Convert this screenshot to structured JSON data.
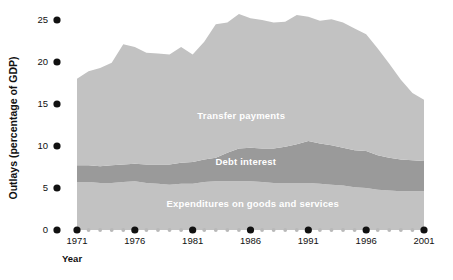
{
  "chart_data": {
    "type": "area",
    "stacked": true,
    "title": "",
    "subtitle": "",
    "xlabel": "Year",
    "ylabel": "Outlays (percentage of GDP)",
    "xlim": [
      1971,
      2001
    ],
    "ylim": [
      0,
      25
    ],
    "grid": false,
    "legend_position": "inline-annotations",
    "x_tick_labels": [
      "1971",
      "1976",
      "1981",
      "1986",
      "1991",
      "1996",
      "2001"
    ],
    "x_tick_values": [
      1971,
      1976,
      1981,
      1986,
      1991,
      1996,
      2001
    ],
    "x_minor_values": [
      1972,
      1973,
      1974,
      1975,
      1977,
      1978,
      1979,
      1980,
      1982,
      1983,
      1984,
      1985,
      1987,
      1988,
      1989,
      1990,
      1992,
      1993,
      1994,
      1995,
      1997,
      1998,
      1999,
      2000
    ],
    "y_tick_labels": [
      "0",
      "5",
      "10",
      "15",
      "20",
      "25"
    ],
    "y_tick_values": [
      0,
      5,
      10,
      15,
      20,
      25
    ],
    "x": [
      1971,
      1972,
      1973,
      1974,
      1975,
      1976,
      1977,
      1978,
      1979,
      1980,
      1981,
      1982,
      1983,
      1984,
      1985,
      1986,
      1987,
      1988,
      1989,
      1990,
      1991,
      1992,
      1993,
      1994,
      1995,
      1996,
      1997,
      1998,
      1999,
      2000,
      2001
    ],
    "series": [
      {
        "name": "Expenditures on goods and services",
        "color": "#c2c2c2",
        "values": [
          5.7,
          5.7,
          5.6,
          5.6,
          5.7,
          5.8,
          5.6,
          5.5,
          5.4,
          5.5,
          5.5,
          5.7,
          5.8,
          5.8,
          5.8,
          5.8,
          5.7,
          5.6,
          5.6,
          5.6,
          5.6,
          5.5,
          5.4,
          5.3,
          5.1,
          5.0,
          4.8,
          4.7,
          4.6,
          4.6,
          4.6
        ]
      },
      {
        "name": "Debt interest",
        "color": "#9a9a9a",
        "values": [
          2.0,
          2.0,
          2.0,
          2.1,
          2.1,
          2.1,
          2.2,
          2.3,
          2.4,
          2.5,
          2.6,
          2.7,
          2.8,
          3.4,
          3.9,
          4.0,
          4.0,
          4.1,
          4.3,
          4.6,
          5.0,
          4.8,
          4.7,
          4.5,
          4.4,
          4.4,
          4.1,
          3.9,
          3.8,
          3.7,
          3.6
        ]
      },
      {
        "name": "Transfer payments",
        "color": "#c2c2c2",
        "values": [
          10.3,
          11.2,
          11.7,
          12.2,
          14.3,
          13.9,
          13.3,
          13.2,
          13.1,
          13.8,
          12.8,
          14.0,
          15.9,
          15.5,
          16.0,
          15.4,
          15.3,
          15.0,
          14.9,
          15.4,
          14.8,
          14.6,
          15.0,
          14.9,
          14.5,
          13.9,
          12.7,
          11.2,
          9.5,
          8.0,
          7.3
        ]
      }
    ],
    "stack_totals": [
      18.0,
      18.9,
      19.3,
      19.9,
      22.1,
      21.8,
      21.1,
      21.0,
      20.9,
      21.8,
      20.9,
      22.4,
      24.5,
      24.7,
      25.7,
      25.2,
      25.0,
      24.7,
      24.8,
      25.6,
      25.4,
      24.9,
      25.1,
      24.7,
      24.0,
      23.3,
      21.6,
      19.8,
      17.9,
      16.3,
      15.5
    ],
    "series_label_positions": [
      {
        "label": "Transfer payments",
        "x": 1985.2,
        "y": 13.2
      },
      {
        "label": "Debt interest",
        "x": 1985.6,
        "y": 7.7
      },
      {
        "label": "Expenditures on goods and services",
        "x": 1986.2,
        "y": 2.7
      }
    ]
  },
  "axes": {
    "y_axis_title": "Outlays (percentage of GDP)",
    "x_axis_title": "Year",
    "tick_marker_color": "#111111",
    "minor_tick_marker_color": "#b9b9b9"
  }
}
